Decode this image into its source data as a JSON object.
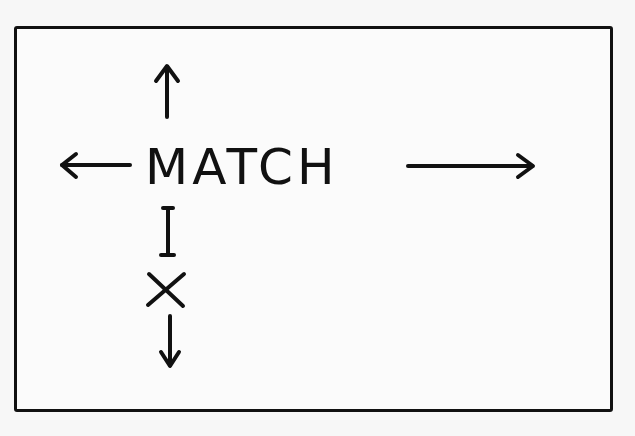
{
  "diagram": {
    "center_word": "MATCH",
    "vertical_word_letters": [
      "I",
      "X"
    ],
    "arrows": [
      {
        "direction": "up",
        "from": "MATCH"
      },
      {
        "direction": "left",
        "from": "MATCH"
      },
      {
        "direction": "right",
        "from": "MATCH"
      },
      {
        "direction": "down",
        "from": "X"
      }
    ],
    "colors": {
      "ink": "#111111",
      "paper": "#f7f7f7"
    }
  }
}
